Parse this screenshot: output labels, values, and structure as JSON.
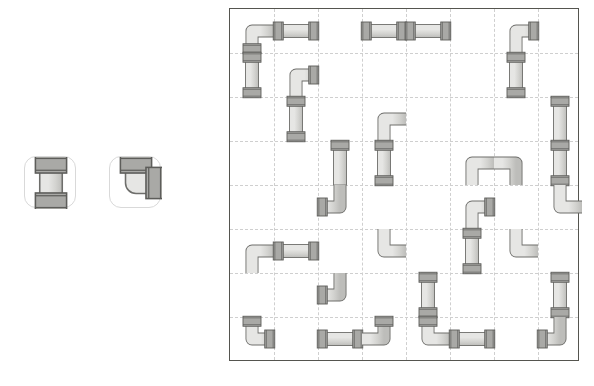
{
  "app": {
    "title": "Pipe Puzzle",
    "background_color": "#ffffff"
  },
  "colors": {
    "pipe_fill_light": "#e6e6e4",
    "pipe_fill_mid": "#d2d2cf",
    "pipe_fill_dark": "#bdbdba",
    "pipe_outline": "#6e6e6b",
    "collar_fill": "#a9a9a6",
    "collar_outline": "#5d5d5a",
    "board_border": "#55554f",
    "grid_line": "#cfcfcf",
    "slot_border": "#d9d9d9",
    "slot_background": "#ffffff"
  },
  "palette": {
    "name": "piece-palette",
    "slot_size": 52,
    "slots": [
      {
        "id": "slot-straight",
        "label": "Straight pipe",
        "icon": "pipe-straight-icon",
        "shape": "straight",
        "orientation": "vertical",
        "x": 24,
        "y": 156
      },
      {
        "id": "slot-elbow",
        "label": "Elbow pipe",
        "icon": "pipe-elbow-icon",
        "shape": "elbow",
        "orientation": "up-right",
        "x": 109,
        "y": 156
      }
    ]
  },
  "board": {
    "name": "puzzle-board",
    "x": 229,
    "y": 8,
    "width": 350,
    "height": 353,
    "cell_size": 44,
    "columns": 8,
    "rows": 8,
    "grid_visible": true,
    "grid_style": "dashed",
    "pieces": [
      {
        "id": "p01",
        "shape": "elbow",
        "orientation": "down-right",
        "col": 0,
        "row": 0,
        "end_caps": [
          "down"
        ]
      },
      {
        "id": "p02",
        "shape": "straight",
        "orientation": "horizontal",
        "col": 1,
        "row": 0,
        "end_caps": [
          "left",
          "right"
        ]
      },
      {
        "id": "p03",
        "shape": "straight",
        "orientation": "vertical",
        "col": 0,
        "row": 1,
        "end_caps": [
          "up",
          "down"
        ]
      },
      {
        "id": "p04",
        "shape": "straight",
        "orientation": "horizontal",
        "col": 3,
        "row": 0,
        "end_caps": [
          "left",
          "right"
        ]
      },
      {
        "id": "p05",
        "shape": "straight",
        "orientation": "horizontal",
        "col": 4,
        "row": 0,
        "end_caps": [
          "left",
          "right"
        ]
      },
      {
        "id": "p06",
        "shape": "elbow",
        "orientation": "down-right",
        "col": 6,
        "row": 0,
        "end_caps": [
          "right"
        ]
      },
      {
        "id": "p07",
        "shape": "straight",
        "orientation": "vertical",
        "col": 6,
        "row": 1,
        "end_caps": [
          "up",
          "down"
        ]
      },
      {
        "id": "p08",
        "shape": "elbow",
        "orientation": "down-right",
        "col": 1,
        "row": 1,
        "end_caps": [
          "right"
        ]
      },
      {
        "id": "p09",
        "shape": "straight",
        "orientation": "vertical",
        "col": 1,
        "row": 2,
        "end_caps": [
          "up",
          "down"
        ]
      },
      {
        "id": "p10",
        "shape": "elbow",
        "orientation": "down-right",
        "col": 3,
        "row": 2,
        "end_caps": [
          "left"
        ]
      },
      {
        "id": "p11",
        "shape": "straight",
        "orientation": "vertical",
        "col": 3,
        "row": 3,
        "end_caps": [
          "up",
          "down"
        ]
      },
      {
        "id": "p12",
        "shape": "straight",
        "orientation": "vertical",
        "col": 7,
        "row": 2,
        "end_caps": [
          "up"
        ]
      },
      {
        "id": "p13",
        "shape": "straight",
        "orientation": "vertical",
        "col": 7,
        "row": 3,
        "end_caps": [
          "up",
          "down"
        ]
      },
      {
        "id": "p14",
        "shape": "straight",
        "orientation": "vertical",
        "col": 2,
        "row": 3,
        "end_caps": [
          "up"
        ]
      },
      {
        "id": "p15",
        "shape": "elbow",
        "orientation": "up-left",
        "col": 2,
        "row": 4,
        "end_caps": [
          "left"
        ]
      },
      {
        "id": "p16",
        "shape": "elbow",
        "orientation": "down-right",
        "col": 5,
        "row": 3,
        "end_caps": [
          "left"
        ]
      },
      {
        "id": "p17",
        "shape": "elbow",
        "orientation": "down-left",
        "col": 6,
        "row": 3,
        "end_caps": [
          "right"
        ]
      },
      {
        "id": "p18",
        "shape": "elbow",
        "orientation": "up-right",
        "col": 7,
        "row": 4,
        "end_caps": [
          "left"
        ]
      },
      {
        "id": "p19",
        "shape": "elbow",
        "orientation": "down-right",
        "col": 5,
        "row": 4,
        "end_caps": [
          "right"
        ]
      },
      {
        "id": "p20",
        "shape": "straight",
        "orientation": "vertical",
        "col": 5,
        "row": 5,
        "end_caps": [
          "up",
          "down"
        ]
      },
      {
        "id": "p21",
        "shape": "elbow",
        "orientation": "down-right",
        "col": 0,
        "row": 5,
        "end_caps": [
          "up"
        ]
      },
      {
        "id": "p22",
        "shape": "straight",
        "orientation": "horizontal",
        "col": 1,
        "row": 5,
        "end_caps": [
          "left",
          "right"
        ]
      },
      {
        "id": "p23",
        "shape": "elbow",
        "orientation": "up-right",
        "col": 3,
        "row": 5,
        "end_caps": [
          "down"
        ]
      },
      {
        "id": "p24",
        "shape": "elbow",
        "orientation": "up-right",
        "col": 6,
        "row": 5,
        "end_caps": [
          "left"
        ]
      },
      {
        "id": "p25",
        "shape": "elbow",
        "orientation": "up-left",
        "col": 2,
        "row": 6,
        "end_caps": [
          "left"
        ]
      },
      {
        "id": "p26",
        "shape": "straight",
        "orientation": "vertical",
        "col": 4,
        "row": 6,
        "end_caps": [
          "up",
          "down"
        ]
      },
      {
        "id": "p27",
        "shape": "straight",
        "orientation": "vertical",
        "col": 7,
        "row": 6,
        "end_caps": [
          "up",
          "down"
        ]
      },
      {
        "id": "p28",
        "shape": "elbow",
        "orientation": "up-right",
        "col": 0,
        "row": 7,
        "end_caps": [
          "up",
          "right"
        ]
      },
      {
        "id": "p29",
        "shape": "straight",
        "orientation": "horizontal",
        "col": 2,
        "row": 7,
        "end_caps": [
          "left",
          "right"
        ]
      },
      {
        "id": "p30",
        "shape": "elbow",
        "orientation": "up-left",
        "col": 3,
        "row": 7,
        "end_caps": [
          "up"
        ]
      },
      {
        "id": "p31",
        "shape": "elbow",
        "orientation": "up-right",
        "col": 4,
        "row": 7,
        "end_caps": [
          "up"
        ]
      },
      {
        "id": "p32",
        "shape": "straight",
        "orientation": "horizontal",
        "col": 5,
        "row": 7,
        "end_caps": [
          "left",
          "right"
        ]
      },
      {
        "id": "p33",
        "shape": "elbow",
        "orientation": "up-left",
        "col": 7,
        "row": 7,
        "end_caps": [
          "left"
        ]
      }
    ]
  }
}
